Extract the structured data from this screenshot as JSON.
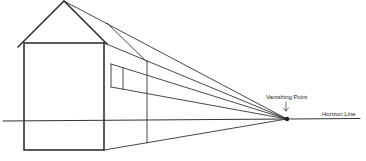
{
  "diagram": {
    "labels": {
      "vanishing_point": "Vanishing Point",
      "horizon_line": "Horizon Line",
      "arrow": "↓"
    },
    "colors": {
      "line": "#333333",
      "background": "#ffffff"
    }
  }
}
